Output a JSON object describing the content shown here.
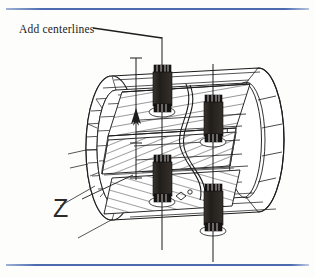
{
  "page": {
    "width": 315,
    "height": 277,
    "background_color": "#fdfdfb",
    "kind": "scanned-technical-drawing"
  },
  "decorations": {
    "top_rule": {
      "name": "top-rule",
      "color": "#5b79b8"
    },
    "bottom_rule": {
      "name": "bottom-rule",
      "color": "#5b79b8"
    }
  },
  "annotations": {
    "add_centerlines": {
      "text": "Add centerlines",
      "x": 19,
      "y": 23,
      "leader_from": [
        93,
        28
      ],
      "leader_to": [
        162,
        38
      ]
    },
    "z_label": {
      "text": "Z",
      "x": 53,
      "y": 196,
      "leader_from": [
        82,
        199
      ],
      "leader_to": [
        133,
        175
      ]
    }
  },
  "drawing": {
    "title": "Isometric sectioned cylindrical assembly with four bolt studs",
    "line_color": "#1d1d1d",
    "fill_color": "#2b2724",
    "centerlines": [
      {
        "name": "centerline-left",
        "x": 162,
        "y1": 37,
        "y2": 250
      },
      {
        "name": "centerline-right",
        "x": 213,
        "y1": 64,
        "y2": 262
      },
      {
        "name": "centerline-edge",
        "x": 136,
        "y1": 58,
        "y2": 180
      }
    ],
    "bolts": [
      {
        "name": "bolt-top-left",
        "cx": 162,
        "cy": 88,
        "w": 16,
        "h": 46
      },
      {
        "name": "bolt-top-right",
        "cx": 213,
        "cy": 118,
        "w": 16,
        "h": 46
      },
      {
        "name": "bolt-bottom-left",
        "cx": 162,
        "cy": 178,
        "w": 16,
        "h": 46
      },
      {
        "name": "bolt-bottom-right",
        "cx": 213,
        "cy": 207,
        "w": 16,
        "h": 46
      }
    ],
    "cylinder": {
      "left_cap_center": [
        112,
        148
      ],
      "right_cap_center": [
        258,
        140
      ],
      "radius_x": 26,
      "radius_y": 72,
      "axis_angle_deg": -6
    }
  }
}
